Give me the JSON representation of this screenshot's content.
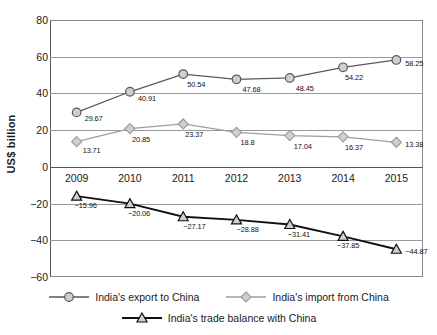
{
  "chart_data": {
    "type": "line",
    "title": "",
    "xlabel": "",
    "ylabel": "US$ billion",
    "categories": [
      "2009",
      "2010",
      "2011",
      "2012",
      "2013",
      "2014",
      "2015"
    ],
    "ylim": [
      -60,
      80
    ],
    "yticks": [
      80,
      60,
      40,
      20,
      0,
      -20,
      -40,
      -60
    ],
    "ytick_labels": [
      "80",
      "60",
      "40",
      "20",
      "0",
      "−20",
      "−40",
      "−60"
    ],
    "grid": true,
    "legend_position": "bottom",
    "series": [
      {
        "name": "India's export to China",
        "marker": "circle",
        "color": "#595959",
        "values": [
          29.67,
          40.91,
          50.54,
          47.68,
          48.45,
          54.22,
          58.25
        ],
        "labels": [
          "29.67",
          "40.91",
          "50.54",
          "47.68",
          "48.45",
          "54.22",
          "58.25"
        ]
      },
      {
        "name": "India's import from China",
        "marker": "diamond",
        "color": "#9e9e9e",
        "values": [
          13.71,
          20.85,
          23.37,
          18.8,
          17.04,
          16.37,
          13.38
        ],
        "labels": [
          "13.71",
          "20.85",
          "23.37",
          "18.8",
          "17.04",
          "16.37",
          "13.38"
        ]
      },
      {
        "name": "India's trade balance with China",
        "marker": "triangle",
        "color": "#111111",
        "values": [
          -15.96,
          -20.06,
          -27.17,
          -28.88,
          -31.41,
          -37.85,
          -44.87
        ],
        "labels": [
          "−15.96",
          "−20.06",
          "−27.17",
          "−28.88",
          "−31.41",
          "−37.85",
          "−44.87"
        ]
      }
    ]
  },
  "label_offsets": {
    "export": [
      [
        8,
        6
      ],
      [
        8,
        6
      ],
      [
        4,
        10
      ],
      [
        6,
        10
      ],
      [
        6,
        10
      ],
      [
        2,
        10
      ],
      [
        9,
        3
      ]
    ],
    "import": [
      [
        6,
        8
      ],
      [
        2,
        10
      ],
      [
        2,
        10
      ],
      [
        4,
        10
      ],
      [
        4,
        10
      ],
      [
        2,
        10
      ],
      [
        9,
        2
      ]
    ],
    "balance": [
      [
        -2,
        9
      ],
      [
        -2,
        9
      ],
      [
        0,
        9
      ],
      [
        0,
        9
      ],
      [
        -2,
        9
      ],
      [
        -6,
        9
      ],
      [
        9,
        2
      ]
    ]
  }
}
